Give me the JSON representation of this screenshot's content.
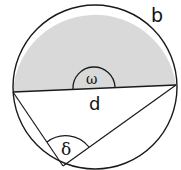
{
  "diagram": {
    "type": "circle-geometry",
    "labels": {
      "arc": "b",
      "chord": "d",
      "angle_top": "ω",
      "angle_bottom": "δ"
    },
    "colors": {
      "stroke": "#1a1a1a",
      "shaded_segment": "#d9d9d9",
      "background": "#ffffff"
    },
    "geometry": {
      "circle": {
        "cx": 95,
        "cy": 87,
        "r": 82
      },
      "chord": {
        "x1": 13,
        "y1": 92,
        "x2": 176,
        "y2": 85
      },
      "vertex_bottom": {
        "x": 63,
        "y": 166
      }
    }
  }
}
